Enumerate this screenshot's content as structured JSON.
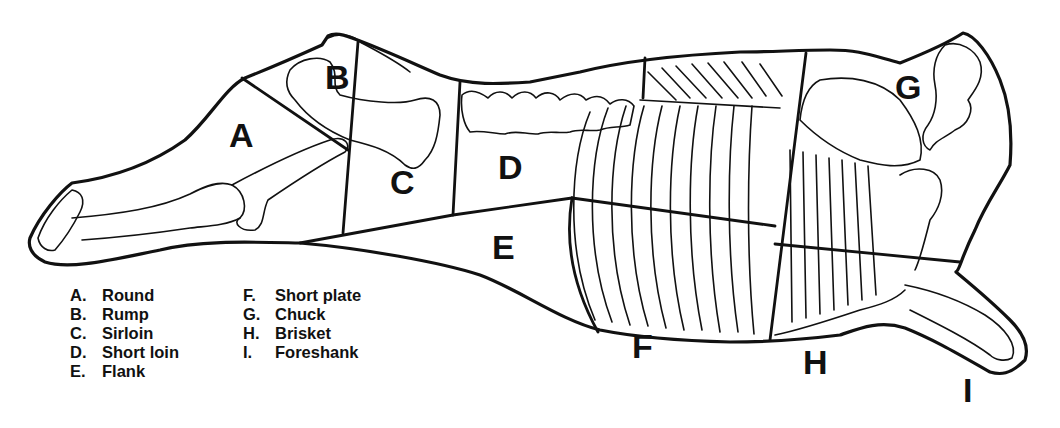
{
  "regions": {
    "A": {
      "letter": "A",
      "name": "Round"
    },
    "B": {
      "letter": "B",
      "name": "Rump"
    },
    "C": {
      "letter": "C",
      "name": "Sirloin"
    },
    "D": {
      "letter": "D",
      "name": "Short loin"
    },
    "E": {
      "letter": "E",
      "name": "Flank"
    },
    "F": {
      "letter": "F",
      "name": "Short plate"
    },
    "G": {
      "letter": "G",
      "name": "Chuck"
    },
    "H": {
      "letter": "H",
      "name": "Brisket"
    },
    "I": {
      "letter": "I",
      "name": "Foreshank"
    }
  },
  "legend": {
    "left": [
      {
        "letter": "A.",
        "name": "Round"
      },
      {
        "letter": "B.",
        "name": "Rump"
      },
      {
        "letter": "C.",
        "name": "Sirloin"
      },
      {
        "letter": "D.",
        "name": "Short loin"
      },
      {
        "letter": "E.",
        "name": "Flank"
      }
    ],
    "right": [
      {
        "letter": "F.",
        "name": "Short plate"
      },
      {
        "letter": "G.",
        "name": "Chuck"
      },
      {
        "letter": "H.",
        "name": "Brisket"
      },
      {
        "letter": "I.",
        "name": "Foreshank"
      }
    ]
  },
  "colors": {
    "line": "#111111",
    "background": "#ffffff"
  }
}
